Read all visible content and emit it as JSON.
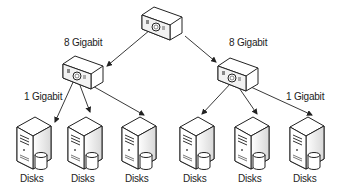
{
  "diagram": {
    "top_switch": {
      "name": "core-switch"
    },
    "links": {
      "left_uplink": "8 Gigabit",
      "right_uplink": "8 Gigabit",
      "left_downlink": "1 Gigabit",
      "right_downlink": "1 Gigabit"
    },
    "servers": [
      {
        "label": "Disks"
      },
      {
        "label": "Disks"
      },
      {
        "label": "Disks"
      },
      {
        "label": "Disks"
      },
      {
        "label": "Disks"
      },
      {
        "label": "Disks"
      }
    ],
    "colors": {
      "stroke": "#222222",
      "fill": "#ffffff",
      "shade": "#e6e6e6"
    }
  }
}
